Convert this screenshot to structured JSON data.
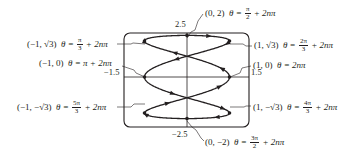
{
  "diagram": {
    "type": "parametric-curve",
    "equations": {
      "x": "cos 3θ",
      "y": "2 sin θ"
    },
    "window": {
      "xmin": -1.5,
      "xmax": 1.5,
      "ymin": -2.5,
      "ymax": 2.5
    },
    "axis_labels": {
      "ymax": "2.5",
      "ymin": "−2.5",
      "xmin": "−1.5",
      "xmax": "1.5"
    },
    "points": [
      {
        "id": "top",
        "coord": "(0, 2)",
        "theta_prefix": "θ =",
        "frac_num": "π",
        "frac_den": "2",
        "suffix": "+ 2nπ"
      },
      {
        "id": "upper-right",
        "coord": "(1, √3)",
        "theta_prefix": "θ =",
        "frac_num": "2π",
        "frac_den": "3",
        "suffix": "+ 2nπ"
      },
      {
        "id": "right",
        "coord": "(1, 0)",
        "theta_text": "θ = 2nπ"
      },
      {
        "id": "lower-right",
        "coord": "(1, −√3)",
        "theta_prefix": "θ =",
        "frac_num": "4π",
        "frac_den": "3",
        "suffix": "+ 2nπ"
      },
      {
        "id": "bottom",
        "coord": "(0, −2)",
        "theta_prefix": "θ =",
        "frac_num": "3π",
        "frac_den": "2",
        "suffix": "+ 2nπ"
      },
      {
        "id": "upper-left",
        "coord": "(−1, √3)",
        "theta_prefix": "θ =",
        "frac_num": "π",
        "frac_den": "3",
        "suffix": "+ 2nπ"
      },
      {
        "id": "left",
        "coord": "(−1, 0)",
        "theta_text": "θ = π + 2nπ"
      },
      {
        "id": "lower-left",
        "coord": "(−1, −√3)",
        "theta_prefix": "θ =",
        "frac_num": "5π",
        "frac_den": "3",
        "suffix": "+ 2nπ"
      }
    ],
    "colors": {
      "ink": "#231f20",
      "background": "#ffffff"
    }
  }
}
